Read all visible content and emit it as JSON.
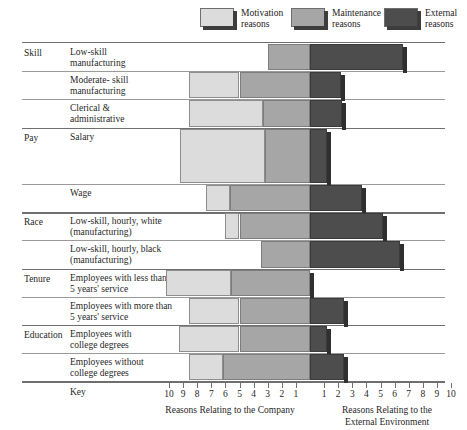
{
  "legend": {
    "items": [
      {
        "label_line1": "Motivation",
        "label_line2": "reasons",
        "key": "motivation",
        "color": "#dcdcdc",
        "x": 200
      },
      {
        "label_line1": "Maintenance",
        "label_line2": "reasons",
        "key": "maintenance",
        "color": "#a6a6a6",
        "x": 291
      },
      {
        "label_line1": "External",
        "label_line2": "reasons",
        "key": "external",
        "color": "#4d4d4d",
        "x": 384
      }
    ]
  },
  "axis": {
    "center_x": 310,
    "unit_px": 14.1,
    "max_units": 10,
    "tick_labels_left": [
      "10",
      "9",
      "8",
      "7",
      "6",
      "5",
      "4",
      "3",
      "2",
      "1"
    ],
    "tick_labels_right": [
      "1",
      "2",
      "3",
      "4",
      "5",
      "6",
      "7",
      "8",
      "9",
      "10"
    ],
    "caption_left": "Reasons Relating to the Company",
    "caption_right_line1": "Reasons Relating to the",
    "caption_right_line2": "External Environment",
    "key_label": "Key"
  },
  "groups": [
    {
      "name": "Skill",
      "label": "Skill"
    },
    {
      "name": "Pay",
      "label": "Pay"
    },
    {
      "name": "Race",
      "label": "Race"
    },
    {
      "name": "Tenure",
      "label": "Tenure"
    },
    {
      "name": "Education",
      "label": "Education"
    }
  ],
  "chart_data": {
    "type": "bar",
    "title": "",
    "subtitle": "",
    "orientation": "horizontal",
    "layout": "diverging-stacked",
    "grid": false,
    "legend_position": "top",
    "xlabel_left": "Reasons Relating to the Company",
    "xlabel_right": "Reasons Relating to the External Environment",
    "xlim": [
      -10,
      10
    ],
    "xticks_left": [
      10,
      9,
      8,
      7,
      6,
      5,
      4,
      3,
      2,
      1
    ],
    "xticks_right": [
      1,
      2,
      3,
      4,
      5,
      6,
      7,
      8,
      9,
      10
    ],
    "series": [
      {
        "name": "Motivation reasons",
        "color": "#dcdcdc"
      },
      {
        "name": "Maintenance reasons",
        "color": "#a6a6a6"
      },
      {
        "name": "External reasons",
        "color": "#4d4d4d"
      }
    ],
    "categories": [
      {
        "group": "Skill",
        "label_line1": "Low-skill",
        "label_line2": "manufacturing",
        "motivation_start": -3.0,
        "motivation_end": -3.0,
        "maintenance_start": -3.0,
        "maintenance_end": 0.0,
        "external_start": 0.0,
        "external_end": 6.6
      },
      {
        "group": "Skill",
        "label_line1": "Moderate- skill",
        "label_line2": "manufacturing",
        "motivation_start": -8.6,
        "motivation_end": -5.0,
        "maintenance_start": -5.0,
        "maintenance_end": 0.0,
        "external_start": 0.0,
        "external_end": 2.2
      },
      {
        "group": "Skill",
        "label_line1": "Clerical &",
        "label_line2": "administrative",
        "motivation_start": -8.6,
        "motivation_end": -3.3,
        "maintenance_start": -3.3,
        "maintenance_end": 0.0,
        "external_start": 0.0,
        "external_end": 2.3
      },
      {
        "group": "Pay",
        "label_line1": "Salary",
        "label_line2": "",
        "tall": true,
        "motivation_start": -9.2,
        "motivation_end": -3.2,
        "maintenance_start": -3.2,
        "maintenance_end": 0.0,
        "external_start": 0.0,
        "external_end": 1.2
      },
      {
        "group": "Pay",
        "label_line1": "Wage",
        "label_line2": "",
        "motivation_start": -7.4,
        "motivation_end": -5.7,
        "maintenance_start": -5.7,
        "maintenance_end": 0.0,
        "external_start": 0.0,
        "external_end": 3.7
      },
      {
        "group": "Race",
        "label_line1": "Low-skill, hourly, white",
        "label_line2": "(manufacturing)",
        "motivation_start": -6.0,
        "motivation_end": -5.0,
        "maintenance_start": -5.0,
        "maintenance_end": 0.0,
        "external_start": 0.0,
        "external_end": 5.2
      },
      {
        "group": "Race",
        "label_line1": "Low-skill, hourly, black",
        "label_line2": "(manufacturing)",
        "motivation_start": -3.5,
        "motivation_end": -3.5,
        "maintenance_start": -3.5,
        "maintenance_end": 0.0,
        "external_start": 0.0,
        "external_end": 6.4
      },
      {
        "group": "Tenure",
        "label_line1": "Employees with less than",
        "label_line2": "5 years' service",
        "motivation_start": -10.2,
        "motivation_end": -5.6,
        "maintenance_start": -5.6,
        "maintenance_end": 0.0,
        "external_start": 0.0,
        "external_end": 0.0
      },
      {
        "group": "Tenure",
        "label_line1": "Employees with more than",
        "label_line2": "5 years' service",
        "motivation_start": -8.6,
        "motivation_end": -5.0,
        "maintenance_start": -5.0,
        "maintenance_end": 0.0,
        "external_start": 0.0,
        "external_end": 2.4
      },
      {
        "group": "Education",
        "label_line1": "Employees with",
        "label_line2": "college degrees",
        "motivation_start": -9.3,
        "motivation_end": -5.0,
        "maintenance_start": -5.0,
        "maintenance_end": 0.0,
        "external_start": 0.0,
        "external_end": 1.2
      },
      {
        "group": "Education",
        "label_line1": "Employees without",
        "label_line2": "college degrees",
        "motivation_start": -8.6,
        "motivation_end": -6.2,
        "maintenance_start": -6.2,
        "maintenance_end": 0.0,
        "external_start": 0.0,
        "external_end": 2.4
      }
    ]
  }
}
